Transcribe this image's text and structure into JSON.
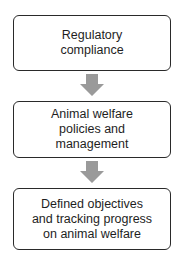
{
  "diagram": {
    "type": "vertical-flowchart",
    "boxes": [
      {
        "label": "Regulatory\ncompliance"
      },
      {
        "label": "Animal welfare\npolicies and\nmanagement"
      },
      {
        "label": "Defined objectives\nand tracking progress\non animal welfare"
      }
    ],
    "arrows": [
      {
        "from": 0,
        "to": 1,
        "direction": "down",
        "color": "#9a9a9a"
      },
      {
        "from": 1,
        "to": 2,
        "direction": "down",
        "color": "#9a9a9a"
      }
    ],
    "colors": {
      "box_border": "#2a2a2a",
      "arrow": "#9a9a9a",
      "text": "#1e1e1e"
    }
  }
}
